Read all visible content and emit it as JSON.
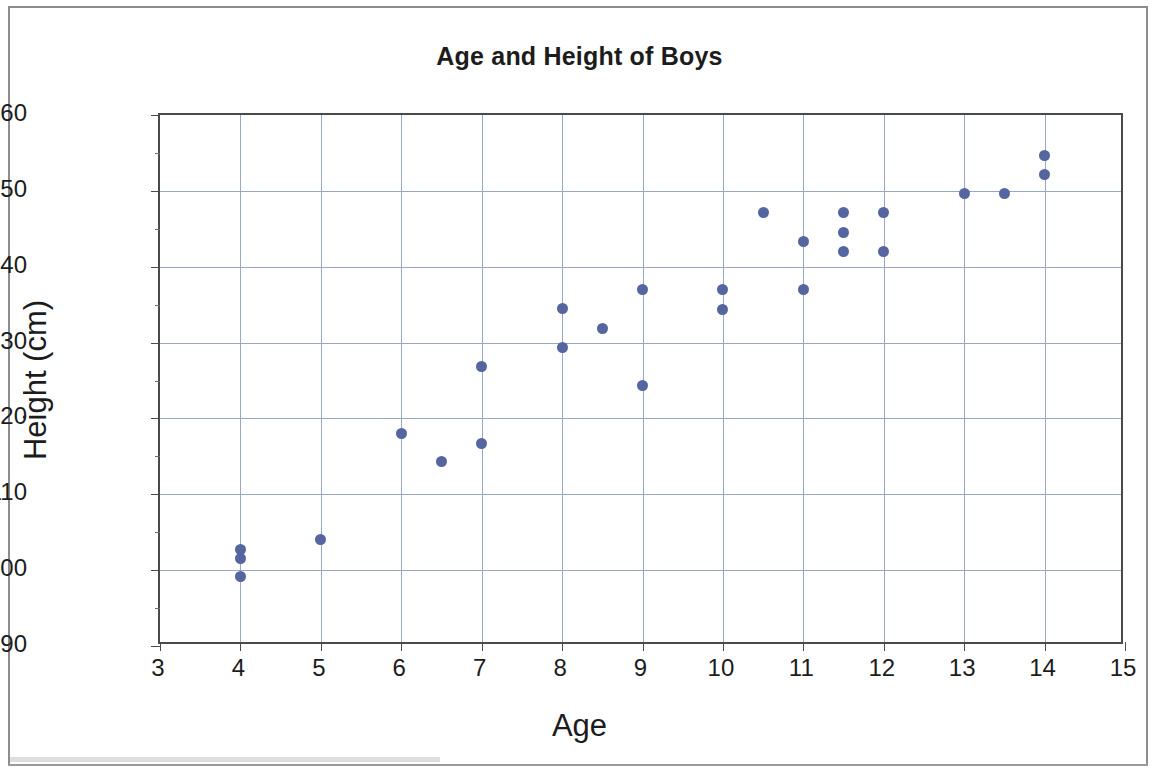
{
  "chart_data": {
    "type": "scatter",
    "title": "Age and Height of Boys",
    "xlabel": "Age",
    "ylabel": "Height (cm)",
    "xlim": [
      3,
      15
    ],
    "ylim": [
      90,
      160
    ],
    "x_ticks": [
      3,
      4,
      5,
      6,
      7,
      8,
      9,
      10,
      11,
      12,
      13,
      14,
      15
    ],
    "y_ticks": [
      90,
      100,
      110,
      120,
      130,
      140,
      150,
      160
    ],
    "x_tick_labels": [
      "3",
      "4",
      "5",
      "6",
      "7",
      "8",
      "9",
      "10",
      "11",
      "12",
      "13",
      "14",
      "15"
    ],
    "y_tick_labels": [
      "90",
      "100",
      "110",
      "120",
      "130",
      "140",
      "150",
      "160"
    ],
    "grid": true,
    "legend": false,
    "marker_color": "#54659F",
    "marker_shape": "circle",
    "points": [
      {
        "x": 4,
        "y": 102.7
      },
      {
        "x": 4,
        "y": 101.6
      },
      {
        "x": 4,
        "y": 99.1
      },
      {
        "x": 5,
        "y": 104.1
      },
      {
        "x": 6,
        "y": 118.0
      },
      {
        "x": 6.5,
        "y": 114.3
      },
      {
        "x": 7,
        "y": 126.9
      },
      {
        "x": 7,
        "y": 116.7
      },
      {
        "x": 8,
        "y": 134.5
      },
      {
        "x": 8,
        "y": 129.4
      },
      {
        "x": 8.5,
        "y": 131.9
      },
      {
        "x": 9,
        "y": 137.0
      },
      {
        "x": 9,
        "y": 124.3
      },
      {
        "x": 10,
        "y": 137.0
      },
      {
        "x": 10,
        "y": 134.4
      },
      {
        "x": 10.5,
        "y": 147.1
      },
      {
        "x": 11,
        "y": 143.3
      },
      {
        "x": 11,
        "y": 137.0
      },
      {
        "x": 11.5,
        "y": 147.1
      },
      {
        "x": 11.5,
        "y": 144.5
      },
      {
        "x": 11.5,
        "y": 142.0
      },
      {
        "x": 12,
        "y": 147.1
      },
      {
        "x": 12,
        "y": 142.0
      },
      {
        "x": 13,
        "y": 149.6
      },
      {
        "x": 13.5,
        "y": 149.6
      },
      {
        "x": 14,
        "y": 154.6
      },
      {
        "x": 14,
        "y": 152.1
      }
    ]
  }
}
